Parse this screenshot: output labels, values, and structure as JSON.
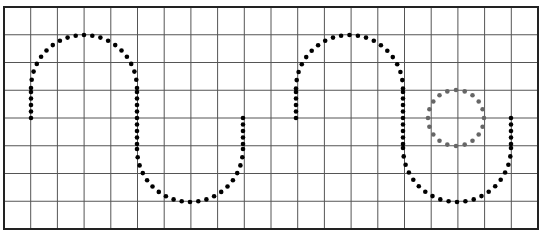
{
  "figure": {
    "grid": {
      "left": 4,
      "top": 7,
      "right": 538,
      "bottom": 229,
      "columns": 20,
      "rows": 8,
      "line_color": "#555555",
      "border_color": "#222222"
    },
    "curves": [
      {
        "name": "curve-1",
        "color": "#000000",
        "start": [
          31,
          118
        ],
        "peak_x": 84,
        "peak_y": 35,
        "mid_x": 137,
        "trough_x": 191,
        "trough_y": 202,
        "end": [
          243,
          118
        ]
      },
      {
        "name": "curve-2",
        "color": "#000000",
        "start": [
          296,
          118
        ],
        "peak_x": 349,
        "peak_y": 35,
        "mid_x": 403,
        "trough_x": 456,
        "trough_y": 202,
        "end": [
          511,
          118
        ]
      }
    ],
    "circle": {
      "color": "#666666",
      "cx": 456,
      "cy": 118,
      "r": 28,
      "dots": 20
    }
  }
}
